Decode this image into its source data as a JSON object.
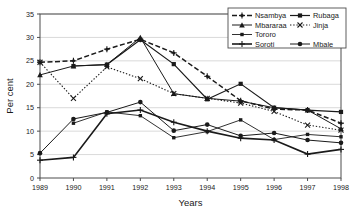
{
  "chart_data": {
    "type": "line",
    "title": "",
    "xlabel": "Years",
    "ylabel": "Per cent",
    "categories": [
      "1989",
      "1990",
      "1991",
      "1992",
      "1993",
      "1994",
      "1995",
      "1996",
      "1997",
      "1998"
    ],
    "x": [
      1989,
      1990,
      1991,
      1992,
      1993,
      1994,
      1995,
      1996,
      1997,
      1998
    ],
    "xlim": [
      1989,
      1998
    ],
    "ylim": [
      0,
      35
    ],
    "yticks": [
      0,
      5,
      10,
      15,
      20,
      25,
      30,
      35
    ],
    "grid": true,
    "legend_position": "top-right",
    "series": [
      {
        "name": "Nsambya",
        "marker": "plus-dot",
        "dash": "dashed",
        "values": [
          24.7,
          25.0,
          27.5,
          29.6,
          26.7,
          21.7,
          16.5,
          14.7,
          14.5,
          11.7
        ]
      },
      {
        "name": "Rubaga",
        "marker": "square",
        "dash": "solid",
        "values": [
          null,
          23.9,
          24.2,
          29.5,
          24.3,
          16.8,
          20.1,
          15.0,
          14.5,
          14.1
        ]
      },
      {
        "name": "Mbararaa",
        "marker": "triangle",
        "dash": "solid",
        "values": [
          22.0,
          23.9,
          24.2,
          30.0,
          18.0,
          17.0,
          16.4,
          15.0,
          14.5,
          10.5
        ]
      },
      {
        "name": "Jinja",
        "marker": "x",
        "dash": "dotted",
        "values": [
          24.7,
          17.0,
          23.7,
          21.2,
          18.0,
          17.0,
          16.0,
          14.2,
          11.3,
          10.2
        ]
      },
      {
        "name": "Tororo",
        "marker": "small-square",
        "dash": "solid",
        "values": [
          null,
          11.7,
          14.1,
          13.3,
          8.6,
          9.9,
          12.4,
          8.2,
          9.3,
          8.8
        ]
      },
      {
        "name": "Soroti",
        "marker": "plus",
        "dash": "solid",
        "values": [
          3.8,
          4.4,
          13.7,
          14.5,
          11.9,
          10.0,
          8.5,
          8.1,
          5.1,
          6.1
        ]
      },
      {
        "name": "Mbale",
        "marker": "circle",
        "dash": "solid",
        "values": [
          5.3,
          12.6,
          14.0,
          16.2,
          10.1,
          11.4,
          9.0,
          9.6,
          8.1,
          7.5
        ]
      }
    ],
    "legend_entries": [
      {
        "label": "Nsambya",
        "column": "left",
        "row": 1
      },
      {
        "label": "Rubaga",
        "column": "right",
        "row": 1
      },
      {
        "label": "Mbararaa",
        "column": "left",
        "row": 2
      },
      {
        "label": "Jinja",
        "column": "right",
        "row": 2
      },
      {
        "label": "Tororo",
        "column": "left",
        "row": 3
      },
      {
        "label": "Soroti",
        "column": "left",
        "row": 4
      },
      {
        "label": "Mbale",
        "column": "right",
        "row": 4
      }
    ],
    "colors": {
      "line": "#1a1a1a",
      "grid": "#c8c8c8",
      "axis": "#4d4d4d",
      "background": "#ffffff"
    }
  }
}
